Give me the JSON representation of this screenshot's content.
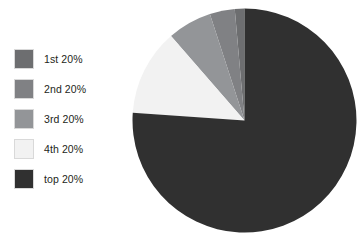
{
  "chart_data": {
    "type": "pie",
    "title": "",
    "categories": [
      "1st 20%",
      "2nd 20%",
      "3rd 20%",
      "4th 20%",
      "top 20%"
    ],
    "values": [
      1.4,
      3.6,
      6.4,
      12.5,
      76.1
    ],
    "value_unit": "percent of total",
    "start_angle_deg": 0,
    "direction": "counterclockwise",
    "legend_position": "left",
    "grid": false,
    "slices": [
      {
        "label": "1st 20%",
        "value": 1.4,
        "sweep_deg": 5,
        "color": "#6d6e70"
      },
      {
        "label": "2nd 20%",
        "value": 3.6,
        "sweep_deg": 13,
        "color": "#808184"
      },
      {
        "label": "3rd 20%",
        "value": 6.4,
        "sweep_deg": 23,
        "color": "#939598"
      },
      {
        "label": "4th 20%",
        "value": 12.5,
        "sweep_deg": 45,
        "color": "#f2f2f2"
      },
      {
        "label": "top 20%",
        "value": 76.1,
        "sweep_deg": 274,
        "color": "#303030"
      }
    ]
  },
  "legend": {
    "items": [
      {
        "label": "1st 20%",
        "color": "#6d6e70"
      },
      {
        "label": "2nd 20%",
        "color": "#808184"
      },
      {
        "label": "3rd 20%",
        "color": "#939598"
      },
      {
        "label": "4th 20%",
        "color": "#f2f2f2"
      },
      {
        "label": "top 20%",
        "color": "#303030"
      }
    ]
  },
  "colors": {
    "background": "#ffffff",
    "text": "#231f20",
    "swatch_border": "#d9d9d9"
  }
}
